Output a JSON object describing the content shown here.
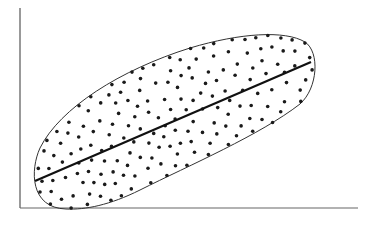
{
  "chart_data": {
    "type": "scatter",
    "title": "",
    "xlabel": "",
    "ylabel": "",
    "grid": false,
    "legend": null,
    "annotations": [
      "elliptical envelope around points",
      "fitted regression line"
    ],
    "xlim": [
      0,
      10
    ],
    "ylim": [
      0,
      10
    ],
    "regression_line": {
      "x": [
        0.4,
        8.3
      ],
      "y": [
        1.4,
        7.4
      ]
    },
    "envelope": {
      "cx": 4.35,
      "cy": 4.4,
      "rx": 4.25,
      "ry": 1.35,
      "angle_deg": 37
    },
    "point_count": 220,
    "colors": {
      "points": "#1a1a1a",
      "line": "#111111",
      "envelope": "#333333",
      "axes": "#555555"
    }
  }
}
